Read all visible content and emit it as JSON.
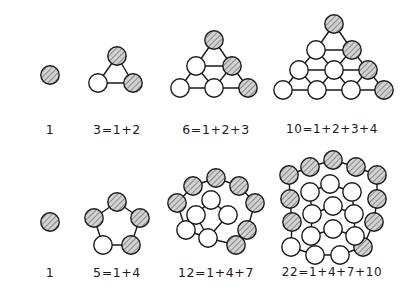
{
  "figure": {
    "background_color": "#ffffff",
    "ink_color": "#1a1a1a",
    "shaded_fill": "#c9c9c9",
    "open_fill": "#ffffff",
    "circle_radius": 9.2,
    "stroke_width": 1.4,
    "hatch_angle_deg": 45
  },
  "rows": [
    {
      "name": "triangular-numbers",
      "label": "Triangular numbers",
      "figures": [
        {
          "id": "tri-1",
          "value": 1,
          "caption": "1",
          "caption_x": 50,
          "caption_y": 122,
          "total_circles": 1,
          "shaded_circles": 1,
          "circles": [
            {
              "x": 50,
              "y": 75,
              "shaded": true
            }
          ],
          "edges": []
        },
        {
          "id": "tri-2",
          "value": 3,
          "caption": "3=1+2",
          "caption_x": 117,
          "caption_y": 122,
          "total_circles": 3,
          "shaded_circles": 2,
          "circles": [
            {
              "x": 117,
              "y": 56,
              "shaded": true
            },
            {
              "x": 98,
              "y": 83,
              "shaded": false
            },
            {
              "x": 133,
              "y": 83,
              "shaded": true
            }
          ],
          "edges": [
            [
              0,
              1
            ],
            [
              0,
              2
            ],
            [
              1,
              2
            ]
          ]
        },
        {
          "id": "tri-3",
          "value": 6,
          "caption": "6=1+2+3",
          "caption_x": 216,
          "caption_y": 122,
          "total_circles": 6,
          "shaded_circles": 3,
          "circles": [
            {
              "x": 214,
              "y": 40,
              "shaded": true
            },
            {
              "x": 196,
              "y": 66,
              "shaded": false
            },
            {
              "x": 232,
              "y": 66,
              "shaded": true
            },
            {
              "x": 180,
              "y": 88,
              "shaded": false
            },
            {
              "x": 214,
              "y": 88,
              "shaded": false
            },
            {
              "x": 248,
              "y": 88,
              "shaded": true
            }
          ],
          "edges": [
            [
              0,
              1
            ],
            [
              0,
              2
            ],
            [
              1,
              2
            ],
            [
              1,
              3
            ],
            [
              1,
              4
            ],
            [
              2,
              4
            ],
            [
              2,
              5
            ],
            [
              3,
              4
            ],
            [
              4,
              5
            ]
          ]
        },
        {
          "id": "tri-4",
          "value": 10,
          "caption": "10=1+2+3+4",
          "caption_x": 332,
          "caption_y": 122,
          "total_circles": 10,
          "shaded_circles": 4,
          "circles": [
            {
              "x": 334,
              "y": 24,
              "shaded": true
            },
            {
              "x": 316,
              "y": 50,
              "shaded": false
            },
            {
              "x": 352,
              "y": 50,
              "shaded": true
            },
            {
              "x": 299,
              "y": 70,
              "shaded": false
            },
            {
              "x": 334,
              "y": 70,
              "shaded": false
            },
            {
              "x": 368,
              "y": 70,
              "shaded": true
            },
            {
              "x": 283,
              "y": 90,
              "shaded": false
            },
            {
              "x": 317,
              "y": 90,
              "shaded": false
            },
            {
              "x": 351,
              "y": 90,
              "shaded": false
            },
            {
              "x": 384,
              "y": 90,
              "shaded": true
            }
          ],
          "edges": [
            [
              0,
              1
            ],
            [
              0,
              2
            ],
            [
              1,
              2
            ],
            [
              1,
              3
            ],
            [
              1,
              4
            ],
            [
              2,
              4
            ],
            [
              2,
              5
            ],
            [
              3,
              4
            ],
            [
              4,
              5
            ],
            [
              3,
              6
            ],
            [
              3,
              7
            ],
            [
              4,
              7
            ],
            [
              4,
              8
            ],
            [
              5,
              8
            ],
            [
              5,
              9
            ],
            [
              6,
              7
            ],
            [
              7,
              8
            ],
            [
              8,
              9
            ]
          ]
        }
      ]
    },
    {
      "name": "pentagonal-numbers",
      "label": "Pentagonal numbers",
      "figures": [
        {
          "id": "pent-1",
          "value": 1,
          "caption": "1",
          "caption_x": 50,
          "caption_y": 265,
          "total_circles": 1,
          "shaded_circles": 1,
          "circles": [
            {
              "x": 50,
              "y": 222,
              "shaded": true
            }
          ],
          "edges": []
        },
        {
          "id": "pent-2",
          "value": 5,
          "caption": "5=1+4",
          "caption_x": 117,
          "caption_y": 265,
          "total_circles": 5,
          "shaded_circles": 4,
          "circles": [
            {
              "x": 117,
              "y": 202,
              "shaded": true
            },
            {
              "x": 94,
              "y": 218,
              "shaded": true
            },
            {
              "x": 140,
              "y": 218,
              "shaded": true
            },
            {
              "x": 103,
              "y": 245,
              "shaded": false
            },
            {
              "x": 131,
              "y": 245,
              "shaded": true
            }
          ],
          "edges": [
            [
              0,
              1
            ],
            [
              0,
              2
            ],
            [
              1,
              3
            ],
            [
              2,
              4
            ],
            [
              3,
              4
            ]
          ]
        },
        {
          "id": "pent-3",
          "value": 12,
          "caption": "12=1+4+7",
          "caption_x": 216,
          "caption_y": 265,
          "total_circles": 12,
          "shaded_circles": 7,
          "circles": [
            {
              "x": 216,
              "y": 178,
              "shaded": true
            },
            {
              "x": 193,
              "y": 186,
              "shaded": true
            },
            {
              "x": 239,
              "y": 186,
              "shaded": true
            },
            {
              "x": 177,
              "y": 203,
              "shaded": true
            },
            {
              "x": 255,
              "y": 203,
              "shaded": true
            },
            {
              "x": 186,
              "y": 230,
              "shaded": false
            },
            {
              "x": 247,
              "y": 230,
              "shaded": true
            },
            {
              "x": 211,
              "y": 200,
              "shaded": false
            },
            {
              "x": 196,
              "y": 215,
              "shaded": false
            },
            {
              "x": 228,
              "y": 215,
              "shaded": false
            },
            {
              "x": 208,
              "y": 238,
              "shaded": false
            },
            {
              "x": 236,
              "y": 245,
              "shaded": true
            }
          ],
          "edges": [
            [
              0,
              1
            ],
            [
              0,
              2
            ],
            [
              1,
              3
            ],
            [
              2,
              4
            ],
            [
              3,
              5
            ],
            [
              4,
              6
            ],
            [
              5,
              10
            ],
            [
              10,
              11
            ],
            [
              11,
              6
            ],
            [
              7,
              8
            ],
            [
              7,
              9
            ],
            [
              8,
              10
            ],
            [
              9,
              10
            ]
          ]
        },
        {
          "id": "pent-4",
          "value": 22,
          "caption": "22=1+4+7+10",
          "caption_x": 332,
          "caption_y": 265,
          "total_circles": 22,
          "shaded_circles": 10,
          "circles": [
            {
              "x": 333,
              "y": 160,
              "shaded": true
            },
            {
              "x": 310,
              "y": 167,
              "shaded": true
            },
            {
              "x": 356,
              "y": 167,
              "shaded": true
            },
            {
              "x": 289,
              "y": 175,
              "shaded": true
            },
            {
              "x": 377,
              "y": 175,
              "shaded": true
            },
            {
              "x": 290,
              "y": 199,
              "shaded": true
            },
            {
              "x": 377,
              "y": 199,
              "shaded": true
            },
            {
              "x": 292,
              "y": 222,
              "shaded": true
            },
            {
              "x": 374,
              "y": 222,
              "shaded": true
            },
            {
              "x": 363,
              "y": 247,
              "shaded": true
            },
            {
              "x": 330,
              "y": 184,
              "shaded": false
            },
            {
              "x": 310,
              "y": 192,
              "shaded": false
            },
            {
              "x": 352,
              "y": 192,
              "shaded": false
            },
            {
              "x": 312,
              "y": 214,
              "shaded": false
            },
            {
              "x": 354,
              "y": 214,
              "shaded": false
            },
            {
              "x": 333,
              "y": 206,
              "shaded": false
            },
            {
              "x": 311,
              "y": 236,
              "shaded": false
            },
            {
              "x": 333,
              "y": 229,
              "shaded": false
            },
            {
              "x": 355,
              "y": 236,
              "shaded": false
            },
            {
              "x": 291,
              "y": 247,
              "shaded": false
            },
            {
              "x": 315,
              "y": 255,
              "shaded": false
            },
            {
              "x": 340,
              "y": 255,
              "shaded": false
            }
          ],
          "edges": [
            [
              0,
              1
            ],
            [
              0,
              2
            ],
            [
              1,
              3
            ],
            [
              2,
              4
            ],
            [
              3,
              5
            ],
            [
              5,
              7
            ],
            [
              4,
              6
            ],
            [
              6,
              8
            ],
            [
              7,
              19
            ],
            [
              19,
              20
            ],
            [
              20,
              21
            ],
            [
              21,
              9
            ],
            [
              9,
              8
            ],
            [
              10,
              11
            ],
            [
              10,
              12
            ],
            [
              11,
              13
            ],
            [
              12,
              14
            ],
            [
              13,
              16
            ],
            [
              14,
              18
            ],
            [
              16,
              17
            ],
            [
              17,
              18
            ],
            [
              15,
              13
            ],
            [
              15,
              14
            ]
          ]
        }
      ]
    }
  ]
}
